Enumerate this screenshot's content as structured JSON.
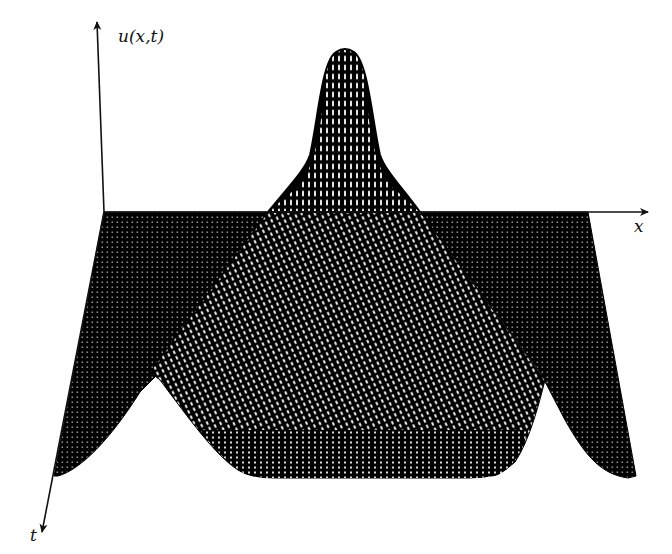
{
  "figure": {
    "type": "3d-surface-mesh",
    "axes": {
      "vertical_label": "u(x,t)",
      "horizontal_label": "x",
      "depth_label": "t"
    },
    "colors": {
      "background": "#ffffff",
      "mesh": "#000000",
      "mesh_gap": "#ffffff",
      "axis": "#111111"
    }
  }
}
